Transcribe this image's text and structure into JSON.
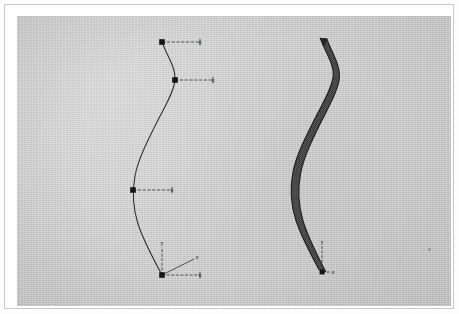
{
  "figure": {
    "caption": "",
    "background_color": "#cfcfcf",
    "page_color": "#fdfdfd",
    "border_color": "#7c7c7c",
    "ink_color": "#2a2a2a",
    "panels": [
      {
        "id": "left-panel",
        "name": "control-polygon-curve",
        "description": "smooth spline curve with square control points and leader lines",
        "curve_points": [
          [
            157,
            37
          ],
          [
            163,
            55
          ],
          [
            170,
            75
          ],
          [
            158,
            112
          ],
          [
            142,
            150
          ],
          [
            131,
            174
          ],
          [
            128,
            196
          ],
          [
            137,
            235
          ],
          [
            152,
            266
          ],
          [
            157,
            270
          ]
        ],
        "control_points": [
          {
            "label": "x",
            "node": [
              157,
              37
            ],
            "leader_end": [
              196,
              37
            ]
          },
          {
            "label": "x",
            "node": [
              170,
              75
            ],
            "leader_end": [
              209,
              75
            ]
          },
          {
            "label": "x",
            "node": [
              128,
              185
            ],
            "leader_end": [
              168,
              185
            ]
          },
          {
            "label": "x",
            "node": [
              157,
              270
            ],
            "leader_end": [
              196,
              270
            ]
          }
        ],
        "axes": {
          "origin": [
            157,
            270
          ],
          "y_label": "y",
          "y_tip": [
            157,
            240
          ],
          "x_label": "x",
          "x_tip": [
            196,
            270
          ],
          "z_label": "x",
          "z_tip": [
            188,
            252
          ]
        }
      },
      {
        "id": "right-panel",
        "name": "meshed-swept-band",
        "description": "same curve rendered as a dense dotted mesh band that widens toward the base",
        "curve_points": [
          [
            319,
            32
          ],
          [
            325,
            50
          ],
          [
            331,
            70
          ],
          [
            319,
            108
          ],
          [
            303,
            147
          ],
          [
            292,
            172
          ],
          [
            289,
            194
          ],
          [
            297,
            233
          ],
          [
            311,
            263
          ],
          [
            316,
            269
          ]
        ],
        "band_widths": [
          1.2,
          1.6,
          2.0,
          2.6,
          3.4,
          4.2,
          5.0,
          6.0,
          6.8,
          7.2
        ],
        "axes": {
          "origin": [
            316,
            269
          ],
          "y_label": "y",
          "y_tip": [
            316,
            241
          ],
          "x_label": "x",
          "x_tip": [
            326,
            269
          ]
        }
      }
    ],
    "artifacts": [
      {
        "name": "scan-speck",
        "position": [
          411,
          232
        ],
        "size": 3
      }
    ]
  }
}
